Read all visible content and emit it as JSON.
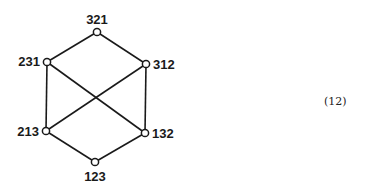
{
  "diagram": {
    "title": "",
    "nodes": [
      {
        "id": "321",
        "label": "321",
        "x": 97,
        "y": 32
      },
      {
        "id": "231",
        "label": "231",
        "x": 47,
        "y": 62
      },
      {
        "id": "312",
        "label": "312",
        "x": 146,
        "y": 64
      },
      {
        "id": "213",
        "label": "213",
        "x": 46,
        "y": 131
      },
      {
        "id": "132",
        "label": "132",
        "x": 145,
        "y": 133
      },
      {
        "id": "123",
        "label": "123",
        "x": 95,
        "y": 162
      }
    ],
    "edges": [
      [
        "321",
        "231"
      ],
      [
        "321",
        "312"
      ],
      [
        "231",
        "213"
      ],
      [
        "231",
        "132"
      ],
      [
        "312",
        "213"
      ],
      [
        "312",
        "132"
      ],
      [
        "213",
        "123"
      ],
      [
        "132",
        "123"
      ]
    ],
    "colors": {
      "line": "#1a1a1a",
      "node_fill": "#ffffff"
    }
  },
  "equation_number": "(12)"
}
